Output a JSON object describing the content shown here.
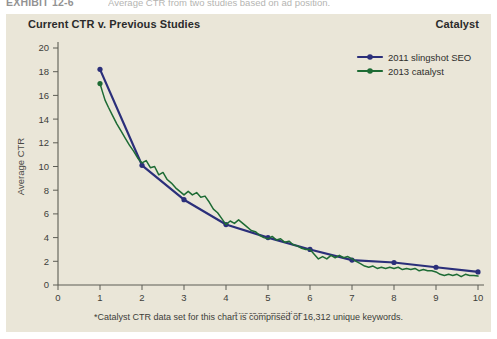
{
  "caption": {
    "exhibit_label": "EXHIBIT 12-6",
    "exhibit_text": "Average CTR from two studies based on ad position."
  },
  "panel": {
    "title": "Current CTR v. Previous Studies",
    "brand": "Catalyst",
    "background_color": "#eae6d8",
    "footnote": "*Catalyst CTR data set for this chart is comprised of 16,312 unique keywords."
  },
  "legend": {
    "position": "top-right",
    "items": [
      {
        "label": "2011 slingshot SEO",
        "color": "#2b2f7a",
        "marker": "circle"
      },
      {
        "label": "2013 catalyst",
        "color": "#1d6b34",
        "marker": "circle"
      }
    ]
  },
  "chart_data": {
    "type": "line",
    "title": "Current CTR v. Previous Studies",
    "xlabel": "Average position",
    "ylabel": "Average CTR",
    "xlim": [
      0,
      10
    ],
    "ylim": [
      0,
      20
    ],
    "xticks": [
      0,
      1,
      2,
      3,
      4,
      5,
      6,
      7,
      8,
      9,
      10
    ],
    "yticks": [
      0,
      2,
      4,
      6,
      8,
      10,
      12,
      14,
      16,
      18,
      20
    ],
    "grid": false,
    "legend_position": "top-right",
    "series": [
      {
        "name": "2011 slingshot SEO",
        "color": "#2b2f7a",
        "marker": "circle",
        "x": [
          1,
          2,
          3,
          4,
          5,
          6,
          7,
          8,
          9,
          10
        ],
        "values": [
          18.2,
          10.1,
          7.2,
          5.1,
          4.0,
          3.0,
          2.1,
          1.9,
          1.5,
          1.1
        ]
      },
      {
        "name": "2013 catalyst",
        "color": "#1d6b34",
        "marker": "circle",
        "x": [
          1.0,
          1.05,
          1.12,
          1.2,
          1.3,
          1.4,
          1.5,
          1.6,
          1.7,
          1.8,
          1.9,
          2.0,
          2.1,
          2.2,
          2.3,
          2.4,
          2.5,
          2.6,
          2.7,
          2.8,
          2.9,
          3.0,
          3.1,
          3.2,
          3.3,
          3.4,
          3.5,
          3.6,
          3.7,
          3.8,
          3.9,
          4.0,
          4.1,
          4.2,
          4.3,
          4.4,
          4.5,
          4.6,
          4.7,
          4.8,
          4.9,
          5.0,
          5.1,
          5.2,
          5.3,
          5.4,
          5.5,
          5.6,
          5.7,
          5.8,
          5.9,
          6.0,
          6.1,
          6.2,
          6.3,
          6.4,
          6.5,
          6.6,
          6.7,
          6.8,
          6.9,
          7.0,
          7.1,
          7.2,
          7.3,
          7.4,
          7.5,
          7.6,
          7.7,
          7.8,
          7.9,
          8.0,
          8.1,
          8.2,
          8.3,
          8.4,
          8.5,
          8.6,
          8.7,
          8.8,
          8.9,
          9.0,
          9.1,
          9.2,
          9.3,
          9.4,
          9.5,
          9.6,
          9.7,
          9.8,
          9.9,
          10.0
        ],
        "values": [
          17.0,
          16.4,
          15.6,
          15.0,
          14.3,
          13.6,
          13.0,
          12.4,
          11.8,
          11.3,
          10.7,
          10.3,
          10.5,
          9.9,
          10.0,
          9.3,
          9.5,
          8.9,
          8.6,
          8.2,
          7.9,
          7.6,
          7.9,
          7.6,
          7.8,
          7.4,
          7.5,
          7.0,
          6.4,
          6.1,
          5.6,
          5.1,
          5.4,
          5.2,
          5.5,
          5.2,
          4.9,
          4.6,
          4.5,
          4.2,
          4.0,
          3.9,
          4.1,
          3.8,
          3.9,
          3.6,
          3.7,
          3.4,
          3.3,
          3.1,
          3.0,
          3.0,
          2.6,
          2.2,
          2.4,
          2.2,
          2.5,
          2.3,
          2.5,
          2.3,
          2.4,
          2.2,
          2.0,
          1.8,
          1.6,
          1.5,
          1.6,
          1.4,
          1.5,
          1.4,
          1.5,
          1.4,
          1.5,
          1.3,
          1.4,
          1.3,
          1.4,
          1.2,
          1.3,
          1.2,
          1.2,
          1.1,
          0.9,
          0.8,
          0.9,
          0.8,
          0.9,
          0.7,
          0.9,
          0.8,
          0.8,
          0.75
        ]
      }
    ]
  }
}
